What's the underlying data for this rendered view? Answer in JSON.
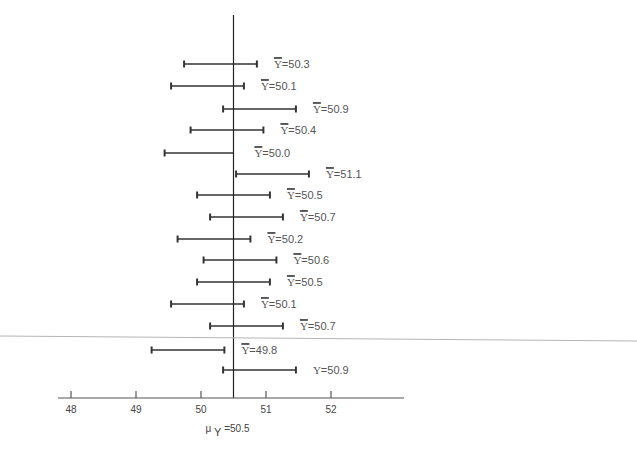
{
  "chart_data": {
    "type": "interval",
    "title": "",
    "xlabel": "",
    "ylabel": "",
    "xlim": [
      47.8,
      53.1
    ],
    "x_ticks": [
      48,
      49,
      50,
      51,
      52
    ],
    "x_tick_labels": [
      "48",
      "49",
      "50",
      "51",
      "52"
    ],
    "grid": false,
    "legend": null,
    "reference_line": {
      "value": 50.5,
      "label_symbol": "μ",
      "label_subscript": "Y",
      "label_rest": "=50.5"
    },
    "half_width": 0.56,
    "intervals": [
      {
        "mean": 50.3,
        "label": "Y̅=50.3",
        "overbar": true,
        "lower": 49.74,
        "upper": 50.86
      },
      {
        "mean": 50.1,
        "label": "Y̅=50.1",
        "overbar": true,
        "lower": 49.54,
        "upper": 50.66
      },
      {
        "mean": 50.9,
        "label": "Y̅=50.9",
        "overbar": true,
        "lower": 50.34,
        "upper": 51.46
      },
      {
        "mean": 50.4,
        "label": "Y̅=50.4",
        "overbar": true,
        "lower": 49.84,
        "upper": 50.96
      },
      {
        "mean": 50.0,
        "label": "Y̅=50.0",
        "overbar": true,
        "lower": 49.44,
        "upper": 50.5,
        "truncated_right": true
      },
      {
        "mean": 51.1,
        "label": "Y̅=51.1",
        "overbar": true,
        "lower": 50.54,
        "upper": 51.66
      },
      {
        "mean": 50.5,
        "label": "Y̅=50.5",
        "overbar": true,
        "lower": 49.94,
        "upper": 51.06
      },
      {
        "mean": 50.7,
        "label": "Y̅=50.7",
        "overbar": true,
        "lower": 50.14,
        "upper": 51.26
      },
      {
        "mean": 50.2,
        "label": "Y̅=50.2",
        "overbar": true,
        "lower": 49.64,
        "upper": 50.76
      },
      {
        "mean": 50.6,
        "label": "Y̅=50.6",
        "overbar": true,
        "lower": 50.04,
        "upper": 51.16
      },
      {
        "mean": 50.5,
        "label": "Y̅=50.5",
        "overbar": true,
        "lower": 49.94,
        "upper": 51.06
      },
      {
        "mean": 50.1,
        "label": "Y̅=50.1",
        "overbar": true,
        "lower": 49.54,
        "upper": 50.66
      },
      {
        "mean": 50.7,
        "label": "Y̅=50.7",
        "overbar": true,
        "lower": 50.14,
        "upper": 51.26
      },
      {
        "mean": 49.8,
        "label": "Y̅=49.8",
        "overbar": true,
        "lower": 49.24,
        "upper": 50.36
      },
      {
        "mean": 50.9,
        "label": "Y=50.9",
        "overbar": false,
        "lower": 50.34,
        "upper": 51.46
      }
    ]
  },
  "layout": {
    "x0_value": 48,
    "x0_px": 71,
    "px_per_unit": 65,
    "axis_y": 398,
    "axis_left": 58,
    "axis_right": 404,
    "ref_top": 15,
    "row_y": [
      64,
      86,
      109,
      130,
      153,
      174,
      195,
      217,
      239,
      260,
      282,
      304,
      326,
      350,
      370
    ],
    "label_gap": 17,
    "label_text": {
      "prefix_letter": "Y",
      "equals": "="
    }
  },
  "colors": {
    "bar": "#333333",
    "axis": "#555555",
    "ref_line": "#222222",
    "label": "#555555",
    "stray_line": "#b5b5b5"
  },
  "stray_line": {
    "x1": 0,
    "y1": 336,
    "x2": 637,
    "y2": 341
  }
}
